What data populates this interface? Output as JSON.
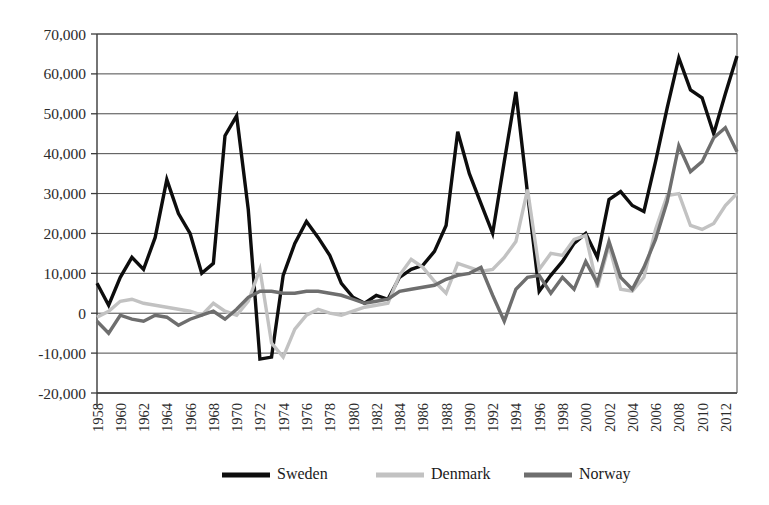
{
  "chart_data": {
    "type": "line",
    "title": "",
    "subtitle": "",
    "xlabel": "",
    "ylabel": "",
    "ylim": [
      -20000,
      70000
    ],
    "ytick_step": 10000,
    "ytick_labels": [
      "70,000",
      "60,000",
      "50,000",
      "40,000",
      "30,000",
      "20,000",
      "10,000",
      "0",
      "-10,000",
      "-20,000"
    ],
    "ytick_values": [
      70000,
      60000,
      50000,
      40000,
      30000,
      20000,
      10000,
      0,
      -10000,
      -20000
    ],
    "grid": true,
    "legend_position": "bottom",
    "xlim": [
      1958,
      2013
    ],
    "xtick_labels": [
      "1958",
      "1960",
      "1962",
      "1964",
      "1966",
      "1968",
      "1970",
      "1972",
      "1974",
      "1976",
      "1978",
      "1980",
      "1982",
      "1984",
      "1986",
      "1988",
      "1990",
      "1992",
      "1994",
      "1996",
      "1998",
      "2000",
      "2002",
      "2004",
      "2006",
      "2008",
      "2010",
      "2012"
    ],
    "xtick_values": [
      1958,
      1960,
      1962,
      1964,
      1966,
      1968,
      1970,
      1972,
      1974,
      1976,
      1978,
      1980,
      1982,
      1984,
      1986,
      1988,
      1990,
      1992,
      1994,
      1996,
      1998,
      2000,
      2002,
      2004,
      2006,
      2008,
      2010,
      2012
    ],
    "x": [
      1958,
      1959,
      1960,
      1961,
      1962,
      1963,
      1964,
      1965,
      1966,
      1967,
      1968,
      1969,
      1970,
      1971,
      1972,
      1973,
      1974,
      1975,
      1976,
      1977,
      1978,
      1979,
      1980,
      1981,
      1982,
      1983,
      1984,
      1985,
      1986,
      1987,
      1988,
      1989,
      1990,
      1991,
      1992,
      1993,
      1994,
      1995,
      1996,
      1997,
      1998,
      1999,
      2000,
      2001,
      2002,
      2003,
      2004,
      2005,
      2006,
      2007,
      2008,
      2009,
      2010,
      2011,
      2012,
      2013
    ],
    "series": [
      {
        "name": "Sweden",
        "color": "#0d0d0d",
        "width": 3.4,
        "values": [
          7500,
          2000,
          9000,
          14000,
          11000,
          19000,
          33500,
          25000,
          20000,
          10000,
          12500,
          44500,
          49500,
          26000,
          -11500,
          -11000,
          9500,
          17500,
          23000,
          19000,
          14500,
          7500,
          4000,
          2500,
          4500,
          3500,
          9000,
          11000,
          12000,
          15500,
          22000,
          45500,
          35000,
          27500,
          20000,
          38000,
          55500,
          30000,
          5500,
          9500,
          13000,
          17500,
          20000,
          14000,
          28500,
          30500,
          27000,
          25500,
          38000,
          51500,
          64000,
          56000,
          54000,
          45000,
          55000,
          64500
        ]
      },
      {
        "name": "Denmark",
        "color": "#c2c2c2",
        "width": 3.4,
        "values": [
          -1000,
          500,
          3000,
          3500,
          2500,
          2000,
          1500,
          1000,
          500,
          -500,
          2500,
          500,
          -500,
          3000,
          11000,
          -7500,
          -11000,
          -4000,
          -500,
          1000,
          0,
          -500,
          500,
          1500,
          2000,
          2500,
          9500,
          13500,
          11500,
          8000,
          5000,
          12500,
          11500,
          10500,
          11000,
          14000,
          18000,
          31000,
          11000,
          15000,
          14500,
          18500,
          19500,
          6500,
          17000,
          6000,
          5500,
          9000,
          21000,
          29500,
          30000,
          22000,
          21000,
          22500,
          27000,
          30000
        ]
      },
      {
        "name": "Norway",
        "color": "#6e6e6e",
        "width": 3.4,
        "values": [
          -2000,
          -5000,
          -500,
          -1500,
          -2000,
          -500,
          -1000,
          -3000,
          -1500,
          -500,
          500,
          -1500,
          1000,
          4000,
          5500,
          5500,
          5000,
          5000,
          5500,
          5500,
          5000,
          4500,
          3500,
          2500,
          3000,
          3500,
          5500,
          6000,
          6500,
          7000,
          8500,
          9500,
          10000,
          11500,
          4500,
          -2000,
          6000,
          9000,
          9500,
          5000,
          9000,
          6000,
          13000,
          7500,
          18000,
          9000,
          6000,
          11500,
          18500,
          28000,
          42000,
          35500,
          38000,
          44000,
          46500,
          40500
        ]
      }
    ],
    "legend": [
      {
        "label": "Sweden",
        "color": "#0d0d0d"
      },
      {
        "label": "Denmark",
        "color": "#c2c2c2"
      },
      {
        "label": "Norway",
        "color": "#6e6e6e"
      }
    ]
  }
}
